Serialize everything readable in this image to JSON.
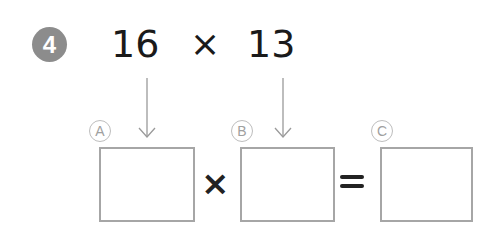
{
  "problem": {
    "number": "4",
    "operand1": "16",
    "operator": "×",
    "operand2": "13"
  },
  "equation": {
    "labels": [
      "A",
      "B",
      "C"
    ],
    "times": "×",
    "equals": "="
  },
  "colors": {
    "badge": "#8c8c8c",
    "text": "#1a1a1a",
    "box_border": "#a6a6a6",
    "label": "#a0a0a0"
  }
}
